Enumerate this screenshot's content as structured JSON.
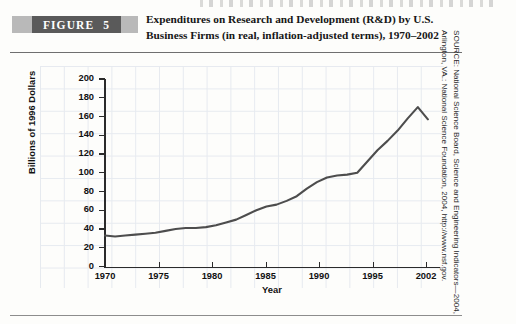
{
  "figure": {
    "banner_word": "FIGURE",
    "banner_number": "5",
    "title": "Expenditures on Research and Development (R&D) by U.S. Business Firms (in real, inflation-adjusted terms), 1970–2002"
  },
  "source_note": "SOURCE: National Science Board, Science and Engineering Indicators—2004, Arlington, VA.: National Science Foundation, 2004, http://www.nsf.gov.",
  "colors": {
    "line": "#4d4d4d",
    "axis": "#2b2b2b",
    "grid": "#dfe4ec",
    "banner_dark": "#5a5a5a",
    "banner_light": "#b9b9b9",
    "text": "#111111",
    "page": "#fdfdfb"
  },
  "chart_data": {
    "type": "line",
    "title": "Expenditures on Research and Development (R&D) by U.S. Business Firms (in real, inflation-adjusted terms), 1970–2002",
    "xlabel": "Year",
    "ylabel": "Billions of 1996 Dollars",
    "xlim": [
      1970,
      2003
    ],
    "ylim": [
      0,
      200
    ],
    "yticks": [
      0,
      20,
      40,
      60,
      80,
      100,
      120,
      140,
      160,
      180,
      200
    ],
    "xticks": [
      1970,
      1975,
      1980,
      1985,
      1990,
      1995,
      2002
    ],
    "xticklabels": [
      "1970",
      "1975",
      "1980",
      "1985",
      "1990",
      "1995",
      "2002"
    ],
    "grid": true,
    "legend": null,
    "series": [
      {
        "name": "R&D expenditures by U.S. business firms",
        "x": [
          1970,
          1971,
          1972,
          1973,
          1974,
          1975,
          1976,
          1977,
          1978,
          1979,
          1980,
          1981,
          1982,
          1983,
          1984,
          1985,
          1986,
          1987,
          1988,
          1989,
          1990,
          1991,
          1992,
          1993,
          1994,
          1995,
          1996,
          1997,
          1998,
          1999,
          2000,
          2001,
          2002
        ],
        "values": [
          33,
          32,
          33,
          34,
          35,
          36,
          38,
          40,
          41,
          41,
          42,
          44,
          47,
          50,
          55,
          60,
          64,
          66,
          70,
          75,
          83,
          90,
          95,
          97,
          98,
          100,
          112,
          124,
          134,
          145,
          158,
          170,
          157
        ]
      }
    ]
  }
}
